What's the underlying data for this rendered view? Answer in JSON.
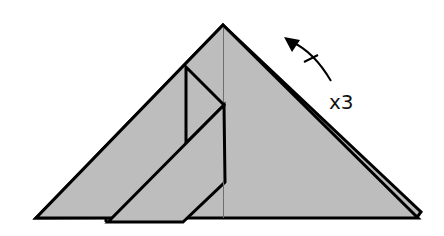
{
  "diagram": {
    "type": "origami-fold-step",
    "repeat_label": "x3",
    "colors": {
      "paper_fill": "#bdbdbd",
      "outline": "#000000",
      "crease": "#6e6e6e",
      "background": "#ffffff"
    },
    "annotations": [
      {
        "kind": "rotate-arrow",
        "direction": "counter-clockwise",
        "has_tick_mark": true
      },
      {
        "kind": "text",
        "value": "x3"
      }
    ],
    "shapes": [
      {
        "name": "back-layer-triangle"
      },
      {
        "name": "main-triangle"
      },
      {
        "name": "center-crease"
      },
      {
        "name": "inner-flap-upper"
      },
      {
        "name": "inner-flap-lower"
      }
    ]
  }
}
